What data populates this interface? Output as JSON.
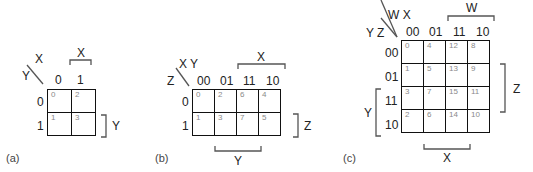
{
  "diagram": {
    "type": "karnaugh-maps",
    "maps": [
      {
        "caption": "(a)",
        "variables": 2,
        "row_var": "Y",
        "col_var": "X",
        "col_headers": [
          "0",
          "1"
        ],
        "row_headers": [
          "0",
          "1"
        ],
        "cells": [
          [
            "0",
            "2"
          ],
          [
            "1",
            "3"
          ]
        ],
        "brackets": {
          "top": "X",
          "right": "Y"
        }
      },
      {
        "caption": "(b)",
        "variables": 3,
        "row_var": "Z",
        "col_var": "X Y",
        "col_headers": [
          "00",
          "01",
          "11",
          "10"
        ],
        "row_headers": [
          "0",
          "1"
        ],
        "cells": [
          [
            "0",
            "2",
            "6",
            "4"
          ],
          [
            "1",
            "3",
            "7",
            "5"
          ]
        ],
        "brackets": {
          "top": "X",
          "right": "Z",
          "bottom": "Y"
        }
      },
      {
        "caption": "(c)",
        "variables": 4,
        "row_var": "Y Z",
        "col_var": "W X",
        "col_headers": [
          "00",
          "01",
          "11",
          "10"
        ],
        "row_headers": [
          "00",
          "01",
          "11",
          "10"
        ],
        "cells": [
          [
            "0",
            "4",
            "12",
            "8"
          ],
          [
            "1",
            "5",
            "13",
            "9"
          ],
          [
            "3",
            "7",
            "15",
            "11"
          ],
          [
            "2",
            "6",
            "14",
            "10"
          ]
        ],
        "brackets": {
          "top": "W",
          "right": "Z",
          "left": "Y",
          "bottom": "X"
        }
      }
    ]
  }
}
